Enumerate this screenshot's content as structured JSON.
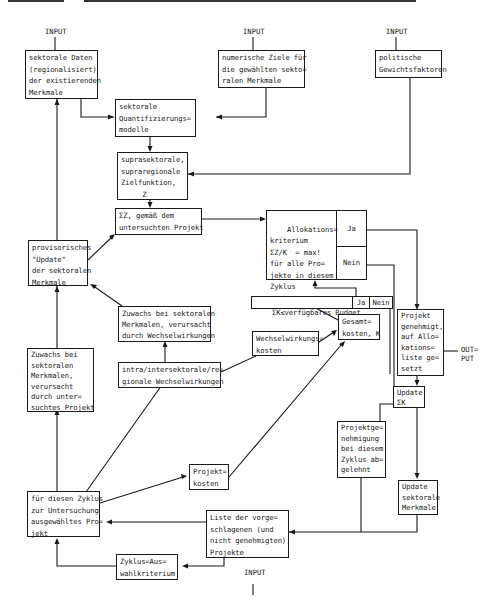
{
  "inputs": {
    "input_1": "INPUT",
    "input_2": "INPUT",
    "input_3": "INPUT",
    "input_4": "INPUT"
  },
  "output_label": "OUT=\nPUT",
  "boxes": {
    "sektorale_daten": "sektorale Daten\n(regionalisiert)\nder existierenden\nMerkmale",
    "numerische_ziele": "numerische Ziele für\ndie gewählten sekto=\nralen Merkmale",
    "politische_gewichte": "politische\nGewichtsfaktoren",
    "quantifizierungsmodelle": "sektorale\nQuantifizierungs=\nmodelle",
    "zielfunktion": "suprasektorale,\nsupraregionale\nZielfunktion,\n     Z",
    "delta_z": "ΣZ, gemäß dem\nuntersuchten Projekt",
    "allokationskriterium": "Allokations=\nkriterium\nΣZ/K  = max!\nfür alle Pro=\njekte in diesem\nZyklus",
    "alloc_ja": "Ja",
    "alloc_nein": "Nein",
    "provisorisches_update": "provisorisches\n\"Update\"\nder sektoralen\nMerkmale",
    "budget_check": "ΣK≤verfügbares Budget",
    "budget_ja": "Ja",
    "budget_nein": "Nein",
    "zuwachs_wechselwirkungen": "Zuwachs bei sektoralen\nMerkmalen, verursacht\ndurch Wechselwirkungen",
    "wechselwirkungskosten": "Wechselwirkungs=\nkosten",
    "gesamtkosten": "Gesamt=\nkosten, K",
    "zuwachs_projekt": "Zuwachs bei\nsektoralen\nMerkmalen,\nverursacht\ndurch unter=\nsuchtes Projekt",
    "intra_inter": "intra/intersektorale/re=\ngionale Wechselwirkungen",
    "projekt_genehmigt": "Projekt\ngenehmigt,\nauf Allo=\nkations=\nliste ge=\nsetzt",
    "update_sum_k": "Update\nΣK",
    "projektgenehmigung_abgelehnt": "Projektge=\nnehmigung\nbei diesem\nZyklus ab=\ngelehnt",
    "projektkosten": "Projekt=\nkosten",
    "update_sektorale": "Update\nsektorale\nMerkmale",
    "ausgewaehltes_projekt": "für diesen Zyklus\nzur Untersuchung\nausgewähltes Pro=\njekt",
    "liste_projekte": "Liste der vorge=\nschlagenen (und\nnicht genehmigten)\nProjekte",
    "zyklus_auswahl": "Zyklus=Aus=\nwahlkriterium"
  }
}
